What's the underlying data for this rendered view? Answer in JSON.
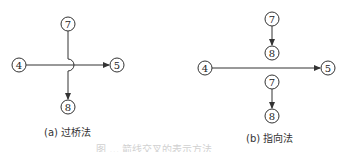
{
  "figure": {
    "caption_partial": "图 … 箭线交叉的表示方法",
    "panels": [
      {
        "id": "a",
        "caption": "(a) 过桥法",
        "nodes": [
          {
            "label": "7",
            "x": 68,
            "y": 24
          },
          {
            "label": "4",
            "x": 19,
            "y": 65
          },
          {
            "label": "5",
            "x": 117,
            "y": 65
          },
          {
            "label": "8",
            "x": 68,
            "y": 107
          }
        ],
        "edges": [
          {
            "from": "4",
            "to": "5",
            "type": "arrow"
          },
          {
            "from": "7",
            "to": "8",
            "type": "arrow-bridge"
          }
        ]
      },
      {
        "id": "b",
        "caption": "(b) 指向法",
        "nodes": [
          {
            "label": "7",
            "x": 272,
            "y": 19
          },
          {
            "label": "8",
            "x": 272,
            "y": 53
          },
          {
            "label": "4",
            "x": 205,
            "y": 68
          },
          {
            "label": "5",
            "x": 328,
            "y": 68
          },
          {
            "label": "7",
            "x": 272,
            "y": 82
          },
          {
            "label": "8",
            "x": 272,
            "y": 116
          }
        ],
        "edges": [
          {
            "from": "7",
            "to": "8",
            "type": "arrow"
          },
          {
            "from": "4",
            "to": "5",
            "type": "arrow"
          },
          {
            "from": "7",
            "to": "8",
            "type": "arrow"
          }
        ]
      }
    ]
  }
}
